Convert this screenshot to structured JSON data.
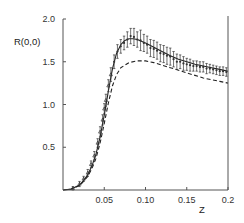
{
  "chart_data": {
    "type": "line",
    "title": "",
    "xlabel": "Z",
    "ylabel": "R(0,0)",
    "xlim": [
      0,
      0.2
    ],
    "ylim": [
      0,
      2.0
    ],
    "grid": false,
    "legend": null,
    "x_ticks": [
      {
        "value": 0.05,
        "label": "0.05"
      },
      {
        "value": 0.1,
        "label": "0.10"
      },
      {
        "value": 0.15,
        "label": "0.15"
      },
      {
        "value": 0.2,
        "label": "0.2"
      }
    ],
    "y_ticks": [
      {
        "value": 0.5,
        "label": "0.5"
      },
      {
        "value": 1.0,
        "label": "1.0"
      },
      {
        "value": 1.5,
        "label": "1.5"
      },
      {
        "value": 2.0,
        "label": "2.0"
      }
    ],
    "series": [
      {
        "name": "theory-solid",
        "style": "solid",
        "x": [
          0.0,
          0.01,
          0.02,
          0.025,
          0.03,
          0.035,
          0.04,
          0.045,
          0.05,
          0.055,
          0.06,
          0.065,
          0.07,
          0.075,
          0.08,
          0.085,
          0.09,
          0.1,
          0.11,
          0.12,
          0.13,
          0.14,
          0.15,
          0.16,
          0.17,
          0.18,
          0.19,
          0.2
        ],
        "y": [
          0.0,
          0.01,
          0.06,
          0.11,
          0.18,
          0.28,
          0.42,
          0.62,
          0.88,
          1.16,
          1.42,
          1.6,
          1.7,
          1.75,
          1.77,
          1.77,
          1.76,
          1.72,
          1.67,
          1.62,
          1.57,
          1.53,
          1.5,
          1.47,
          1.45,
          1.43,
          1.41,
          1.39
        ]
      },
      {
        "name": "theory-dashed",
        "style": "dashed",
        "x": [
          0.0,
          0.01,
          0.02,
          0.025,
          0.03,
          0.035,
          0.04,
          0.045,
          0.05,
          0.055,
          0.06,
          0.065,
          0.07,
          0.08,
          0.09,
          0.1,
          0.11,
          0.12,
          0.13,
          0.14,
          0.15,
          0.16,
          0.17,
          0.18,
          0.19,
          0.2
        ],
        "y": [
          0.0,
          0.01,
          0.05,
          0.1,
          0.16,
          0.25,
          0.37,
          0.55,
          0.78,
          1.02,
          1.22,
          1.35,
          1.43,
          1.49,
          1.51,
          1.51,
          1.49,
          1.46,
          1.43,
          1.4,
          1.37,
          1.34,
          1.31,
          1.29,
          1.27,
          1.25
        ]
      },
      {
        "name": "experimental-data",
        "style": "points-with-errorbars",
        "x": [
          0.012,
          0.02,
          0.025,
          0.03,
          0.034,
          0.038,
          0.042,
          0.045,
          0.048,
          0.05,
          0.052,
          0.055,
          0.058,
          0.062,
          0.066,
          0.07,
          0.074,
          0.078,
          0.082,
          0.086,
          0.09,
          0.094,
          0.098,
          0.102,
          0.106,
          0.11,
          0.114,
          0.118,
          0.122,
          0.126,
          0.13,
          0.134,
          0.138,
          0.142,
          0.146,
          0.15,
          0.154,
          0.158,
          0.162,
          0.166,
          0.17,
          0.174,
          0.178,
          0.182,
          0.186,
          0.19,
          0.194,
          0.198
        ],
        "y": [
          0.02,
          0.07,
          0.13,
          0.2,
          0.3,
          0.4,
          0.55,
          0.68,
          0.82,
          0.95,
          1.05,
          1.22,
          1.35,
          1.5,
          1.62,
          1.68,
          1.72,
          1.76,
          1.8,
          1.79,
          1.76,
          1.75,
          1.72,
          1.7,
          1.66,
          1.65,
          1.63,
          1.6,
          1.59,
          1.57,
          1.56,
          1.53,
          1.5,
          1.5,
          1.48,
          1.47,
          1.46,
          1.45,
          1.45,
          1.44,
          1.44,
          1.42,
          1.42,
          1.41,
          1.4,
          1.39,
          1.39,
          1.38
        ],
        "err": [
          0.02,
          0.03,
          0.03,
          0.04,
          0.04,
          0.05,
          0.05,
          0.06,
          0.06,
          0.06,
          0.07,
          0.07,
          0.08,
          0.08,
          0.08,
          0.08,
          0.08,
          0.09,
          0.09,
          0.1,
          0.09,
          0.12,
          0.1,
          0.1,
          0.1,
          0.1,
          0.1,
          0.1,
          0.1,
          0.1,
          0.1,
          0.09,
          0.09,
          0.08,
          0.08,
          0.07,
          0.07,
          0.06,
          0.06,
          0.06,
          0.06,
          0.06,
          0.05,
          0.05,
          0.05,
          0.05,
          0.05,
          0.05
        ]
      }
    ]
  },
  "colors": {
    "axis": "#555555",
    "line": "#222222",
    "points": "#333333",
    "background": "#ffffff"
  }
}
